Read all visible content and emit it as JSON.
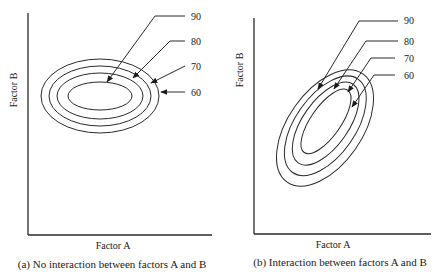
{
  "panels": [
    {
      "id": "a",
      "x_axis_label": "Factor A",
      "y_axis_label": "Factor B",
      "caption": "(a) No interaction between factors A and B",
      "contour_labels": [
        "90",
        "80",
        "70",
        "60"
      ],
      "contour_shape": "axis-aligned ellipses"
    },
    {
      "id": "b",
      "x_axis_label": "Factor A",
      "y_axis_label": "Factor B",
      "caption": "(b) Interaction between factors A and B",
      "contour_labels": [
        "90",
        "80",
        "70",
        "60"
      ],
      "contour_shape": "tilted ellipses"
    }
  ],
  "colors": {
    "line": "#2a2a2a",
    "text": "#1a1a1a",
    "background": "#ffffff"
  }
}
